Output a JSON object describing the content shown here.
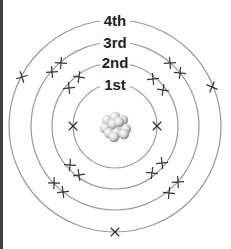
{
  "diagram": {
    "colors": {
      "ring": "#9a9a9a",
      "electron": "#333333",
      "label": "#222222",
      "nucleus": "#cfcfcf",
      "edge": "#444444"
    },
    "center": [
      115,
      126
    ],
    "shells": [
      {
        "label": "1st",
        "radius": 42,
        "label_y": 90,
        "electrons": [
          [
            73,
            126
          ],
          [
            157,
            126
          ]
        ]
      },
      {
        "label": "2nd",
        "radius": 63,
        "label_y": 68,
        "electrons": [
          [
            69,
            88
          ],
          [
            79,
            77
          ],
          [
            153,
            79
          ],
          [
            163,
            90
          ],
          [
            70,
            165
          ],
          [
            79,
            175
          ],
          [
            152,
            173
          ],
          [
            162,
            163
          ]
        ]
      },
      {
        "label": "3rd",
        "radius": 84,
        "label_y": 48,
        "electrons": [
          [
            52,
            72
          ],
          [
            61,
            63
          ],
          [
            170,
            63
          ],
          [
            180,
            73
          ],
          [
            54,
            183
          ],
          [
            63,
            192
          ],
          [
            169,
            193
          ],
          [
            178,
            182
          ]
        ]
      },
      {
        "label": "4th",
        "radius": 106,
        "label_y": 26,
        "electrons": [
          [
            22,
            77
          ],
          [
            212,
            87
          ],
          [
            115,
            232
          ]
        ]
      }
    ]
  }
}
